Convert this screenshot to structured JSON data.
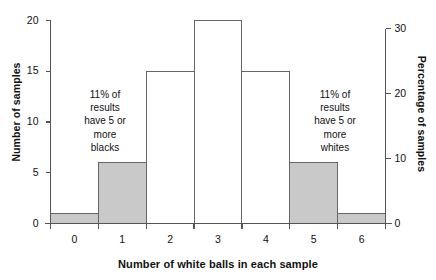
{
  "chart_data": {
    "type": "bar",
    "title": "",
    "subtitle": "",
    "xlabel": "Number of white balls in each sample",
    "ylabel": "Number of samples",
    "y2label": "Percentage of samples",
    "categories": [
      "0",
      "1",
      "2",
      "3",
      "4",
      "5",
      "6"
    ],
    "values": [
      1,
      6,
      15,
      20,
      15,
      6,
      1
    ],
    "percentage_values": [
      1.5,
      9,
      23,
      30,
      23,
      9,
      1.5
    ],
    "bar_fill": [
      "gray",
      "gray",
      "white",
      "white",
      "white",
      "gray",
      "gray"
    ],
    "ylim": [
      0,
      20
    ],
    "y2lim": [
      0,
      30
    ],
    "yticks": [
      "0",
      "5",
      "10",
      "15",
      "20"
    ],
    "ytick_values": [
      0,
      5,
      10,
      15,
      20
    ],
    "y2ticks": [
      "0",
      "10",
      "20",
      "30"
    ],
    "y2tick_values": [
      0,
      10,
      20,
      30
    ],
    "xticks": [
      "0",
      "1",
      "2",
      "3",
      "4",
      "5",
      "6"
    ],
    "grid": false,
    "legend": null,
    "colors": {
      "bar_gray_fill": "#c9c9c9",
      "bar_white_fill": "#ffffff",
      "bar_stroke": "#666666",
      "axis": "#555555",
      "text": "#111111"
    },
    "annotations": [
      {
        "id": "left",
        "text": "11% of\nresults\nhave 5 or\nmore\nblacks"
      },
      {
        "id": "right",
        "text": "11% of\nresults\nhave 5 or\nmore\nwhites"
      }
    ]
  }
}
